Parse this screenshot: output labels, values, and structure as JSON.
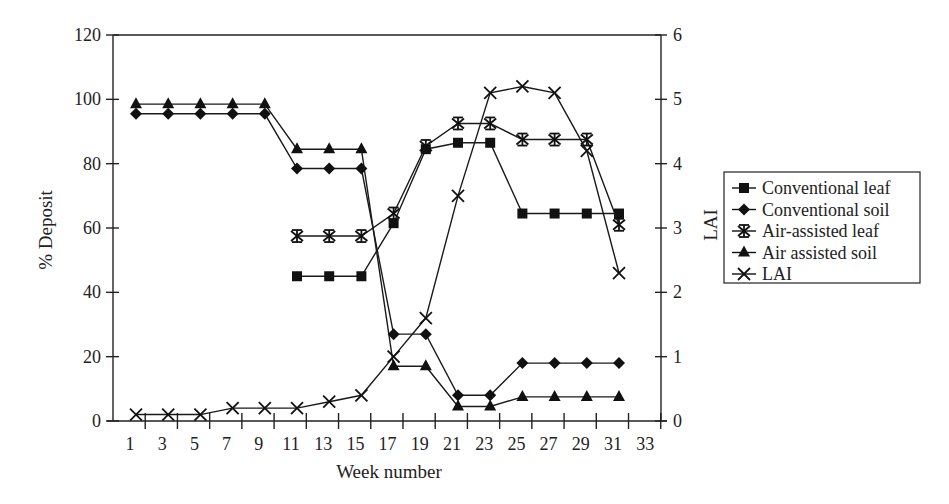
{
  "chart_data": {
    "type": "line",
    "title": "",
    "xlabel": "Week number",
    "ylabel": "% Deposit",
    "y2label": "LAI",
    "x_tick_labels": [
      "1",
      "3",
      "5",
      "7",
      "9",
      "11",
      "13",
      "15",
      "17",
      "19",
      "21",
      "23",
      "25",
      "27",
      "29",
      "31",
      "33"
    ],
    "y_tick_labels": [
      "0",
      "20",
      "40",
      "60",
      "80",
      "100",
      "120"
    ],
    "y2_tick_labels": [
      "0",
      "1",
      "2",
      "3",
      "4",
      "5",
      "6"
    ],
    "ylim": [
      0,
      120
    ],
    "y2lim": [
      0,
      6
    ],
    "xlim": [
      0,
      34
    ],
    "grid": false,
    "legend_position": "right",
    "x": [
      1,
      3,
      5,
      7,
      9,
      11,
      13,
      15,
      17,
      19,
      21,
      23,
      25,
      27,
      29,
      31
    ],
    "series": [
      {
        "name": "Conventional leaf",
        "marker": "square",
        "axis": "left",
        "values": [
          null,
          null,
          null,
          null,
          null,
          45,
          45,
          45,
          61.5,
          84.5,
          86.5,
          86.5,
          64.5,
          64.5,
          64.5,
          64.5
        ]
      },
      {
        "name": "Conventional soil",
        "marker": "diamond",
        "axis": "left",
        "values": [
          95.5,
          95.5,
          95.5,
          95.5,
          95.5,
          78.5,
          78.5,
          78.5,
          27,
          27,
          8,
          8,
          18,
          18,
          18,
          18
        ]
      },
      {
        "name": "Air-assisted leaf",
        "marker": "asterisk",
        "axis": "left",
        "values": [
          null,
          null,
          null,
          null,
          null,
          57.5,
          57.5,
          57.5,
          64.5,
          85.5,
          92.5,
          92.5,
          87.5,
          87.5,
          87.5,
          61
        ]
      },
      {
        "name": "Air assisted soil",
        "marker": "triangle",
        "axis": "left",
        "values": [
          98.5,
          98.5,
          98.5,
          98.5,
          98.5,
          84.5,
          84.5,
          84.5,
          17,
          17,
          4.5,
          4.5,
          7.5,
          7.5,
          7.5,
          7.5
        ]
      },
      {
        "name": "LAI",
        "marker": "x",
        "axis": "right",
        "values": [
          0.1,
          0.1,
          0.1,
          0.2,
          0.2,
          0.2,
          0.3,
          0.4,
          1.0,
          1.6,
          3.5,
          5.1,
          5.2,
          5.1,
          4.2,
          2.3
        ]
      }
    ]
  },
  "legend": {
    "items": [
      {
        "label": "Conventional leaf",
        "marker": "square"
      },
      {
        "label": "Conventional soil",
        "marker": "diamond"
      },
      {
        "label": "Air-assisted leaf",
        "marker": "asterisk"
      },
      {
        "label": "Air assisted soil",
        "marker": "triangle"
      },
      {
        "label": "LAI",
        "marker": "x"
      }
    ]
  },
  "colors": {
    "ink": "#1a1a1a",
    "background": "#ffffff"
  }
}
